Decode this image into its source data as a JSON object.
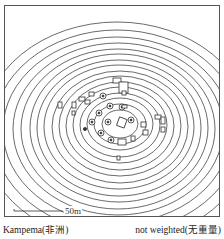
{
  "figure": {
    "site_name": "Kampema(非洲)",
    "weighting": "not weighted(无重量)",
    "scale_bar_label": "50m",
    "line_color": "#333333",
    "background": "#ffffff"
  }
}
